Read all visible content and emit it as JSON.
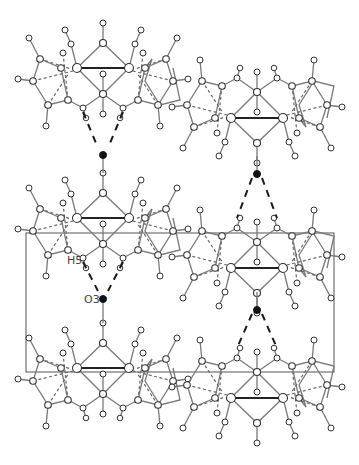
{
  "figure": {
    "type": "crystal packing diagram",
    "background": "#ffffff",
    "labels": {
      "h5": "H5",
      "o3": "O3"
    },
    "unit_cell": {
      "x": 26,
      "y": 233,
      "width": 308,
      "height": 139
    },
    "molecules": [
      {
        "id": "mol-left-top",
        "cx": 103,
        "cy": 68
      },
      {
        "id": "mol-left-middle",
        "cx": 103,
        "cy": 218
      },
      {
        "id": "mol-left-bottom",
        "cx": 103,
        "cy": 368
      },
      {
        "id": "mol-right-top",
        "cx": 257,
        "cy": 118,
        "flip": true
      },
      {
        "id": "mol-right-middle",
        "cx": 257,
        "cy": 268,
        "flip": true
      },
      {
        "id": "mol-right-bottom",
        "cx": 257,
        "cy": 398,
        "flip": true
      }
    ],
    "water_oxygens": [
      {
        "id": "o-left-1",
        "x": 103,
        "y": 154
      },
      {
        "id": "o-left-2",
        "x": 103,
        "y": 298
      },
      {
        "id": "o-right-1",
        "x": 257,
        "y": 174
      },
      {
        "id": "o-right-2",
        "x": 257,
        "y": 310
      }
    ]
  }
}
